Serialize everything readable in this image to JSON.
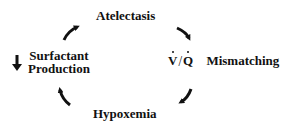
{
  "diagram": {
    "type": "cycle",
    "direction": "clockwise",
    "nodes": [
      {
        "id": "atelectasis",
        "label": "Atelectasis"
      },
      {
        "id": "vq",
        "ratio_numerator": "V",
        "ratio_denominator": "Q",
        "label": "Mismatching"
      },
      {
        "id": "hypoxemia",
        "label": "Hypoxemia"
      },
      {
        "id": "surfactant",
        "indicator": "decrease-arrow",
        "label_line1": "Surfactant",
        "label_line2": "Production"
      }
    ],
    "edges": [
      {
        "from": "atelectasis",
        "to": "vq"
      },
      {
        "from": "vq",
        "to": "hypoxemia"
      },
      {
        "from": "hypoxemia",
        "to": "surfactant"
      },
      {
        "from": "surfactant",
        "to": "atelectasis"
      }
    ],
    "colors": {
      "ink": "#111111",
      "background": "#ffffff"
    }
  }
}
